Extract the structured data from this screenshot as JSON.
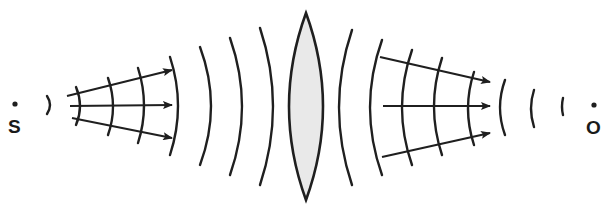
{
  "diagram": {
    "colors": {
      "ink": "#1f1f1f",
      "lens_fill": "#e9e9e9",
      "background": "#ffffff"
    },
    "source": {
      "label": "S",
      "x": 15,
      "y": 104
    },
    "image_point": {
      "label": "O",
      "x": 594,
      "y": 105
    },
    "lens": {
      "type": "biconvex",
      "cx": 306,
      "top": 13,
      "bottom": 200,
      "half_width": 17
    },
    "wavefronts_left": [
      {
        "x": 47,
        "top": 96,
        "bottom": 114,
        "bulge": 3
      },
      {
        "x": 76,
        "top": 87,
        "bottom": 125,
        "bulge": 4
      },
      {
        "x": 108,
        "top": 78,
        "bottom": 135,
        "bulge": 5
      },
      {
        "x": 138,
        "top": 68,
        "bottom": 143,
        "bulge": 6
      },
      {
        "x": 170,
        "top": 57,
        "bottom": 155,
        "bulge": 8
      },
      {
        "x": 200,
        "top": 47,
        "bottom": 165,
        "bulge": 11
      },
      {
        "x": 230,
        "top": 38,
        "bottom": 175,
        "bulge": 12
      },
      {
        "x": 260,
        "top": 28,
        "bottom": 185,
        "bulge": 13
      }
    ],
    "wavefronts_right": [
      {
        "x": 352,
        "top": 30,
        "bottom": 185,
        "bulge": 13
      },
      {
        "x": 382,
        "top": 40,
        "bottom": 175,
        "bulge": 12
      },
      {
        "x": 412,
        "top": 50,
        "bottom": 165,
        "bulge": 10
      },
      {
        "x": 442,
        "top": 58,
        "bottom": 155,
        "bulge": 8
      },
      {
        "x": 474,
        "top": 72,
        "bottom": 145,
        "bulge": 6
      },
      {
        "x": 505,
        "top": 80,
        "bottom": 135,
        "bulge": 5
      },
      {
        "x": 534,
        "top": 90,
        "bottom": 127,
        "bulge": 3
      },
      {
        "x": 563,
        "top": 98,
        "bottom": 115,
        "bulge": 1
      }
    ],
    "rays_left": [
      {
        "x1": 67,
        "y1": 96,
        "x2": 172,
        "y2": 70
      },
      {
        "x1": 70,
        "y1": 106,
        "x2": 172,
        "y2": 105
      },
      {
        "x1": 72,
        "y1": 118,
        "x2": 172,
        "y2": 138
      }
    ],
    "rays_right": [
      {
        "x1": 380,
        "y1": 57,
        "x2": 490,
        "y2": 82
      },
      {
        "x1": 383,
        "y1": 106,
        "x2": 490,
        "y2": 106
      },
      {
        "x1": 382,
        "y1": 157,
        "x2": 490,
        "y2": 133
      }
    ]
  }
}
